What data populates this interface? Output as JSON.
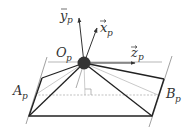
{
  "diagram": {
    "labels": {
      "y_axis": "y",
      "x_axis": "x",
      "z_axis": "z",
      "origin": "O",
      "point_a": "A",
      "point_b": "B",
      "subscript": "p",
      "vector_mark": "⃗"
    },
    "colors": {
      "line": "#222222",
      "light_line": "#b0b0b0",
      "sphere": "#333333"
    }
  }
}
